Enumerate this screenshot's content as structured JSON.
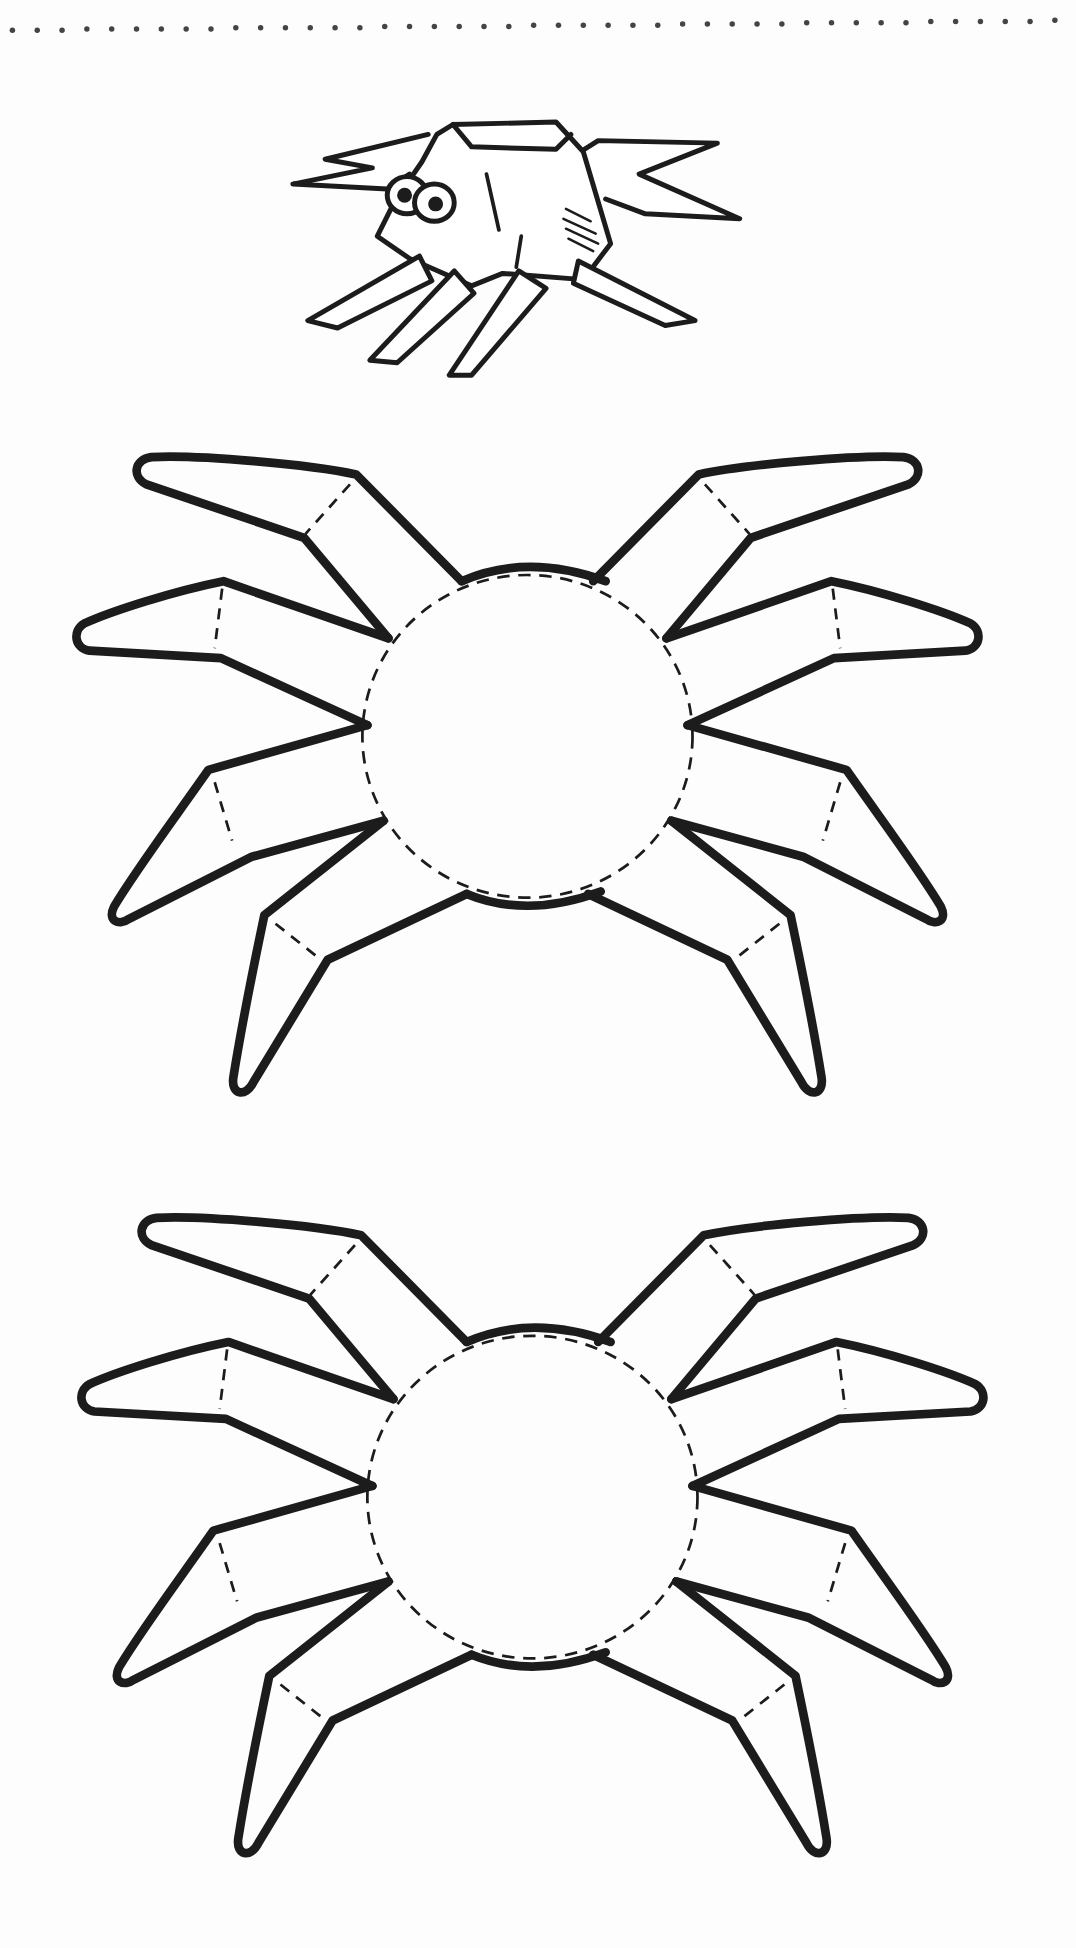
{
  "sheet": {
    "title": "Spider cut-out template",
    "background_color": "#fdfdfd",
    "ink_color": "#1c1c1c",
    "perforation": {
      "style": "dotted-line",
      "dot_count": 43,
      "color": "#444444"
    }
  },
  "illustration": {
    "name": "example-folded-spider",
    "description": "Finished origami-style spider with googly eyes"
  },
  "templates": [
    {
      "name": "spider-template-1",
      "legs": 8,
      "fold_lines": "dashed",
      "body": "circle"
    },
    {
      "name": "spider-template-2",
      "legs": 8,
      "fold_lines": "dashed",
      "body": "circle"
    }
  ]
}
